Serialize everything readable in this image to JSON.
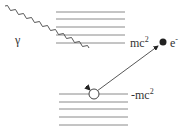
{
  "diagram": {
    "type": "dirac-sea-pair-production",
    "labels": {
      "photon": "γ",
      "positive_energy": "mc",
      "positive_energy_sup": "2",
      "negative_energy": "-mc",
      "negative_energy_sup": "2",
      "electron": "e",
      "electron_sup": "-"
    },
    "upper_levels_count": 5,
    "lower_levels_count": 5,
    "nodes": [
      {
        "id": "hole",
        "label": "",
        "style": "open-circle"
      },
      {
        "id": "electron",
        "label": "e-",
        "style": "filled-circle"
      }
    ],
    "edges": [
      {
        "from": "photon",
        "to": "hole",
        "style": "wavy-arrow"
      },
      {
        "from": "hole",
        "to": "electron",
        "style": "straight-arrow"
      }
    ],
    "colors": {
      "lines": "#8a8a8a",
      "arrows": "#333333",
      "electron_fill": "#222222",
      "hole_fill": "#ffffff"
    }
  }
}
